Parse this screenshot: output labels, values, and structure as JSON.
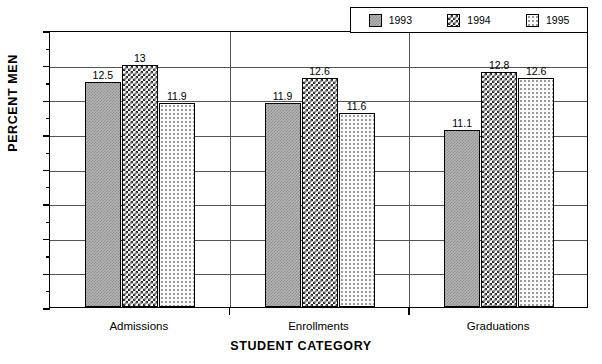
{
  "chart_data": {
    "type": "bar",
    "title": "PERCENT MEN BY STUDENT CATEGORY AND YEAR",
    "categories": [
      "Admissions",
      "Enrollments",
      "Graduations"
    ],
    "series": [
      {
        "name": "1993",
        "values": [
          12.5,
          13,
          11.9
        ],
        "pattern": "dense-gray-checker",
        "swatch_color": "#b6b6b6"
      },
      {
        "name": "1994",
        "values": [
          11.9,
          12.6,
          12.8
        ],
        "pattern": "bold-checker",
        "swatch_color": "#ffffff"
      },
      {
        "name": "1995",
        "values": [
          11.6,
          11.6,
          12.6
        ],
        "pattern": "sparse-dots",
        "swatch_color": "#fafafa"
      }
    ],
    "bars": [
      {
        "category": "Admissions",
        "year": "1993",
        "value": 12.5,
        "label": "12.5"
      },
      {
        "category": "Admissions",
        "year": "1994",
        "value": 13.0,
        "label": "13"
      },
      {
        "category": "Admissions",
        "year": "1995",
        "value": 11.9,
        "label": "11.9"
      },
      {
        "category": "Enrollments",
        "year": "1993",
        "value": 11.9,
        "label": "11.9"
      },
      {
        "category": "Enrollments",
        "year": "1994",
        "value": 12.6,
        "label": "12.6"
      },
      {
        "category": "Enrollments",
        "year": "1995",
        "value": 11.6,
        "label": "11.6"
      },
      {
        "category": "Graduations",
        "year": "1993",
        "value": 11.1,
        "label": "11.1"
      },
      {
        "category": "Graduations",
        "year": "1994",
        "value": 12.8,
        "label": "12.8"
      },
      {
        "category": "Graduations",
        "year": "1995",
        "value": 12.6,
        "label": "12.6"
      }
    ],
    "xlabel": "STUDENT CATEGORY",
    "ylabel": "PERCENT MEN",
    "ylim": [
      6,
      14
    ],
    "ytick_step": 1,
    "yticks": [
      "6",
      "7",
      "8",
      "9",
      "10",
      "11",
      "12",
      "13",
      "14"
    ],
    "minor_ticks": true,
    "grid": "horizontal",
    "legend_position": "top-right",
    "title_clipped": true
  },
  "legend": {
    "entries": [
      {
        "label": "1993"
      },
      {
        "label": "1994"
      },
      {
        "label": "1995"
      }
    ]
  },
  "axis": {
    "y_title": "PERCENT MEN",
    "x_title": "STUDENT CATEGORY"
  }
}
